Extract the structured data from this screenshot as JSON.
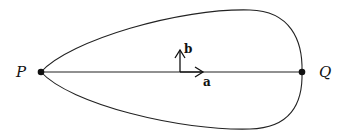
{
  "diagram": {
    "type": "closed-curve-with-chord",
    "colors": {
      "stroke": "#222222",
      "background": "#ffffff"
    },
    "points": [
      {
        "id": "P",
        "label": "P",
        "x": 41,
        "y": 72
      },
      {
        "id": "Q",
        "label": "Q",
        "x": 302,
        "y": 72
      }
    ],
    "segment": {
      "from": "P",
      "to": "Q"
    },
    "vectors": [
      {
        "id": "a",
        "label": "a",
        "direction": "right",
        "origin": [
          180,
          72
        ],
        "tip": [
          203,
          72
        ]
      },
      {
        "id": "b",
        "label": "b",
        "direction": "up",
        "origin": [
          180,
          72
        ],
        "tip": [
          180,
          49
        ]
      }
    ],
    "labels": {
      "P": "P",
      "Q": "Q",
      "a": "a",
      "b": "b"
    }
  }
}
